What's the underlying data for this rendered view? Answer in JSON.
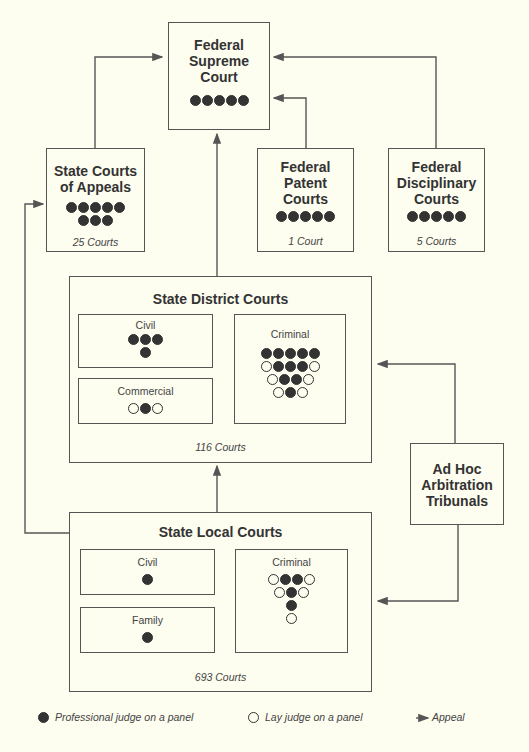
{
  "supreme": {
    "title_lines": [
      "Federal",
      "Supreme",
      "Court"
    ],
    "judges": [
      [
        "p",
        "p",
        "p",
        "p",
        "p"
      ]
    ]
  },
  "appeals": {
    "title_lines": [
      "State Courts",
      "of Appeals"
    ],
    "judges": [
      [
        "p",
        "p",
        "p",
        "p",
        "p"
      ],
      [
        "p",
        "p",
        "p"
      ]
    ],
    "count": "25 Courts"
  },
  "patent": {
    "title_lines": [
      "Federal",
      "Patent",
      "Courts"
    ],
    "judges": [
      [
        "p",
        "p",
        "p",
        "p",
        "p"
      ]
    ],
    "count": "1 Court"
  },
  "disciplinary": {
    "title_lines": [
      "Federal",
      "Disciplinary",
      "Courts"
    ],
    "judges": [
      [
        "p",
        "p",
        "p",
        "p",
        "p"
      ]
    ],
    "count": "5 Courts"
  },
  "district": {
    "title": "State District Courts",
    "count": "116 Courts",
    "civil": {
      "label": "Civil",
      "judges": [
        [
          "p",
          "p",
          "p"
        ],
        [
          "p"
        ]
      ]
    },
    "commercial": {
      "label": "Commercial",
      "judges": [
        [
          "l",
          "p",
          "l"
        ]
      ]
    },
    "criminal": {
      "label": "Criminal",
      "judges": [
        [
          "p",
          "p",
          "p",
          "p",
          "p"
        ],
        [
          "l",
          "p",
          "p",
          "p",
          "l"
        ],
        [
          "l",
          "p",
          "p",
          "l"
        ],
        [
          "l",
          "p",
          "l"
        ]
      ]
    }
  },
  "local": {
    "title": "State Local Courts",
    "count": "693 Courts",
    "civil": {
      "label": "Civil",
      "judges": [
        [
          "p"
        ]
      ]
    },
    "family": {
      "label": "Family",
      "judges": [
        [
          "p"
        ]
      ]
    },
    "criminal": {
      "label": "Criminal",
      "judges": [
        [
          "l",
          "p",
          "p",
          "l"
        ],
        [
          "l",
          "p",
          "l"
        ],
        [
          "p"
        ],
        [
          "l"
        ]
      ]
    }
  },
  "arbitration": {
    "title_lines": [
      "Ad Hoc",
      "Arbitration",
      "Tribunals"
    ]
  },
  "legend": {
    "professional": "Professional judge on a panel",
    "lay": "Lay judge on a panel",
    "appeal": "Appeal"
  },
  "colors": {
    "background": "#fdfdf0",
    "line": "#555555",
    "professional_dot": "#333333"
  }
}
